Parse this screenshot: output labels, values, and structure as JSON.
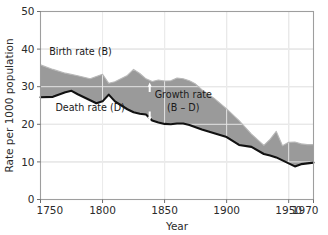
{
  "chart_data": {
    "type": "area",
    "title": "",
    "xlabel": "Year",
    "ylabel": "Rate per 1000 population",
    "xlim": [
      1750,
      1970
    ],
    "ylim": [
      0,
      50
    ],
    "grid": true,
    "legend_position": "inline-annotations",
    "x_ticks": [
      "1750",
      "1800",
      "1850",
      "1900",
      "1950",
      "1970"
    ],
    "x_tick_values": [
      1750,
      1800,
      1850,
      1900,
      1950,
      1970
    ],
    "y_ticks": [
      "0",
      "10",
      "20",
      "30",
      "40",
      "50"
    ],
    "y_tick_values": [
      0,
      10,
      20,
      30,
      40,
      50
    ],
    "fill_color": "#9a9a9a",
    "death_line_color": "#111111",
    "birth_line_color": "#b4b4b4",
    "grid_color_on_white": "#cccccc",
    "grid_color_on_fill": "#f2f2f2",
    "series": [
      {
        "name": "Birth rate (B)",
        "x": [
          1750,
          1760,
          1770,
          1780,
          1790,
          1800,
          1805,
          1810,
          1820,
          1825,
          1830,
          1835,
          1840,
          1845,
          1850,
          1855,
          1860,
          1865,
          1870,
          1875,
          1880,
          1890,
          1900,
          1910,
          1920,
          1930,
          1935,
          1940,
          1945,
          1950,
          1955,
          1960,
          1965,
          1970
        ],
        "values": [
          35.8,
          34.6,
          33.6,
          32.9,
          32.1,
          33.3,
          30.9,
          31.3,
          33.0,
          34.6,
          33.5,
          32.1,
          31.4,
          31.8,
          31.5,
          31.6,
          32.3,
          32.1,
          31.6,
          30.7,
          29.2,
          26.9,
          24.1,
          21.0,
          17.4,
          14.4,
          16.0,
          18.1,
          14.3,
          15.2,
          15.3,
          14.8,
          14.6,
          14.6
        ]
      },
      {
        "name": "Death rate (D)",
        "x": [
          1750,
          1760,
          1770,
          1775,
          1780,
          1790,
          1795,
          1800,
          1805,
          1810,
          1820,
          1825,
          1830,
          1835,
          1840,
          1845,
          1850,
          1855,
          1860,
          1865,
          1870,
          1875,
          1880,
          1890,
          1900,
          1910,
          1920,
          1930,
          1935,
          1940,
          1945,
          1950,
          1955,
          1960,
          1965,
          1970
        ],
        "values": [
          27.2,
          27.3,
          28.5,
          28.9,
          28.0,
          26.4,
          25.6,
          26.1,
          27.9,
          26.1,
          24.0,
          23.2,
          22.8,
          22.6,
          21.0,
          20.5,
          20.1,
          20.0,
          20.2,
          20.2,
          19.8,
          19.2,
          18.6,
          17.6,
          16.6,
          14.5,
          14.0,
          12.1,
          11.7,
          11.2,
          10.4,
          9.6,
          8.8,
          9.4,
          9.6,
          9.8
        ]
      }
    ],
    "annotations": [
      {
        "name": "birth-rate-label",
        "text": "Birth rate (B)",
        "x": 1757,
        "y": 38.5
      },
      {
        "name": "death-rate-label",
        "text": "Death rate (D)",
        "x": 1762,
        "y": 23.5
      },
      {
        "name": "growth-rate-label-line1",
        "text": "Growth rate",
        "x": 1842,
        "y": 27.0
      },
      {
        "name": "growth-rate-label-line2",
        "text": "(B – D)",
        "x": 1852,
        "y": 23.6
      },
      {
        "name": "growth-rate-up-arrow",
        "text": "↑",
        "x": 1838,
        "y": 30.0
      },
      {
        "name": "growth-rate-down-arrow",
        "text": "↓",
        "x": 1838,
        "y": 22.0
      }
    ]
  },
  "axes": {
    "x_title": "Year",
    "y_title": "Rate per 1000 population",
    "x_tick_labels": [
      "1750",
      "1800",
      "1850",
      "1900",
      "1950",
      "1970"
    ],
    "y_tick_labels": [
      "50",
      "40",
      "30",
      "20",
      "10",
      "0"
    ]
  },
  "labels": {
    "birth_rate": "Birth rate (B)",
    "death_rate": "Death rate (D)",
    "growth_rate_line1": "Growth rate",
    "growth_rate_line2": "(B – D)"
  }
}
